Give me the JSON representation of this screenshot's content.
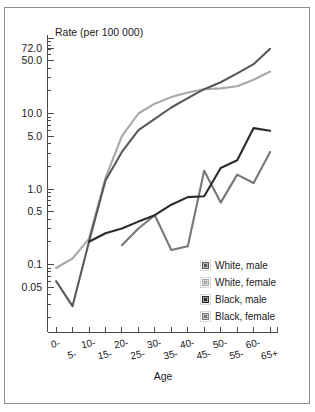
{
  "figure": {
    "border_color": "#8d8d8d",
    "background": "#ffffff"
  },
  "axis_title_y": "Rate (per 100 000)",
  "axis_title_x": "Age",
  "legend": {
    "position": "inside-lower-right",
    "items": [
      {
        "label": "White, male",
        "color": "#595959"
      },
      {
        "label": "White, female",
        "color": "#a8a8a8"
      },
      {
        "label": "Black, male",
        "color": "#2b2b2b"
      },
      {
        "label": "Black, female",
        "color": "#777777"
      }
    ]
  },
  "chart_data": {
    "type": "line",
    "title": "Rate (per 100 000)",
    "xlabel": "Age",
    "ylabel": "Rate (per 100 000)",
    "yscale": "log",
    "ylim": [
      0.025,
      85
    ],
    "grid": false,
    "ytick_labels": [
      "72.0",
      "50.0",
      "10.0",
      "5.0",
      "1.0",
      "0.5",
      "0.1",
      "0.05"
    ],
    "ytick_values": [
      72.0,
      50.0,
      10.0,
      5.0,
      1.0,
      0.5,
      0.1,
      0.05
    ],
    "categories": [
      "0-",
      "5-",
      "10-",
      "15-",
      "20-",
      "25-",
      "30-",
      "35-",
      "40-",
      "45-",
      "50-",
      "55-",
      "60-",
      "65+"
    ],
    "series": [
      {
        "name": "White, male",
        "color": "#595959",
        "values": [
          0.06,
          0.028,
          0.2,
          1.3,
          3.1,
          6.0,
          8.5,
          12.0,
          16.0,
          21.0,
          26.0,
          34.0,
          45.0,
          72.0
        ]
      },
      {
        "name": "White, female",
        "color": "#a8a8a8",
        "values": [
          0.09,
          0.12,
          0.22,
          1.4,
          5.0,
          10.0,
          13.5,
          16.5,
          19.0,
          21.0,
          21.5,
          23.0,
          28.0,
          36.0
        ]
      },
      {
        "name": "Black, male",
        "color": "#2b2b2b",
        "values": [
          null,
          null,
          0.2,
          0.26,
          0.3,
          0.37,
          0.45,
          0.62,
          0.78,
          0.8,
          1.9,
          2.4,
          6.4,
          5.9
        ]
      },
      {
        "name": "Black, female",
        "color": "#777777",
        "values": [
          null,
          null,
          null,
          null,
          0.18,
          0.3,
          0.45,
          0.155,
          0.175,
          1.75,
          0.66,
          1.55,
          1.2,
          3.1
        ]
      }
    ]
  }
}
